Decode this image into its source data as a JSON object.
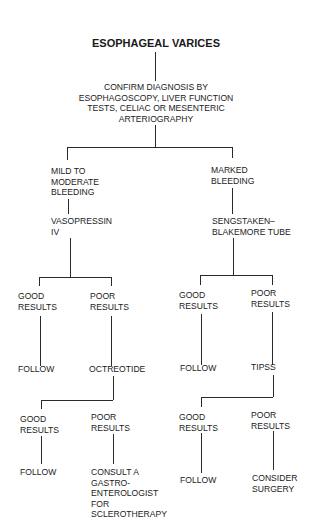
{
  "title": "ESOPHAGEAL VARICES",
  "nodes": {
    "confirm": [
      "CONFIRM DIAGNOSIS BY",
      "ESOPHAGOSCOPY, LIVER FUNCTION",
      "TESTS, CELIAC OR MESENTERIC",
      "ARTERIOGRAPHY"
    ],
    "mild": [
      "MILD TO",
      "MODERATE",
      "BLEEDING"
    ],
    "vasopressin": [
      "VASOPRESSIN",
      "IV"
    ],
    "marked": [
      "MARKED",
      "BLEEDING"
    ],
    "sengstaken": [
      "SENGSTAKEN–",
      "BLAKEMORE TUBE"
    ],
    "l_good1": [
      "GOOD",
      "RESULTS"
    ],
    "l_poor1": [
      "POOR",
      "RESULTS"
    ],
    "l_follow1": [
      "FOLLOW"
    ],
    "octreotide": [
      "OCTREOTIDE"
    ],
    "l_good2": [
      "GOOD",
      "RESULTS"
    ],
    "l_poor2": [
      "POOR",
      "RESULTS"
    ],
    "l_follow2": [
      "FOLLOW"
    ],
    "consult": [
      "CONSULT A",
      "GASTRO-",
      "ENTEROLOGIST",
      "FOR",
      "SCLEROTHERAPY"
    ],
    "r_good1": [
      "GOOD",
      "RESULTS"
    ],
    "r_poor1": [
      "POOR",
      "RESULTS"
    ],
    "r_follow1": [
      "FOLLOW"
    ],
    "tipss": [
      "TIPSS"
    ],
    "r_good2": [
      "GOOD",
      "RESULTS"
    ],
    "r_poor2": [
      "POOR",
      "RESULTS"
    ],
    "r_follow2": [
      "FOLLOW"
    ],
    "surgery": [
      "CONSIDER",
      "SURGERY"
    ]
  },
  "tree": {
    "label": "ESOPHAGEAL VARICES",
    "children": [
      {
        "label": "CONFIRM DIAGNOSIS BY ESOPHAGOSCOPY, LIVER FUNCTION TESTS, CELIAC OR MESENTERIC ARTERIOGRAPHY",
        "children": [
          {
            "label": "MILD TO MODERATE BLEEDING",
            "children": [
              {
                "label": "VASOPRESSIN IV",
                "children": [
                  {
                    "label": "GOOD RESULTS",
                    "children": [
                      {
                        "label": "FOLLOW"
                      }
                    ]
                  },
                  {
                    "label": "POOR RESULTS",
                    "children": [
                      {
                        "label": "OCTREOTIDE",
                        "children": [
                          {
                            "label": "GOOD RESULTS",
                            "children": [
                              {
                                "label": "FOLLOW"
                              }
                            ]
                          },
                          {
                            "label": "POOR RESULTS",
                            "children": [
                              {
                                "label": "CONSULT A GASTRO-ENTEROLOGIST FOR SCLEROTHERAPY"
                              }
                            ]
                          }
                        ]
                      }
                    ]
                  }
                ]
              }
            ]
          },
          {
            "label": "MARKED BLEEDING",
            "children": [
              {
                "label": "SENGSTAKEN–BLAKEMORE TUBE",
                "children": [
                  {
                    "label": "GOOD RESULTS",
                    "children": [
                      {
                        "label": "FOLLOW"
                      }
                    ]
                  },
                  {
                    "label": "POOR RESULTS",
                    "children": [
                      {
                        "label": "TIPSS",
                        "children": [
                          {
                            "label": "GOOD RESULTS",
                            "children": [
                              {
                                "label": "FOLLOW"
                              }
                            ]
                          },
                          {
                            "label": "POOR RESULTS",
                            "children": [
                              {
                                "label": "CONSIDER SURGERY"
                              }
                            ]
                          }
                        ]
                      }
                    ]
                  }
                ]
              }
            ]
          }
        ]
      }
    ]
  }
}
